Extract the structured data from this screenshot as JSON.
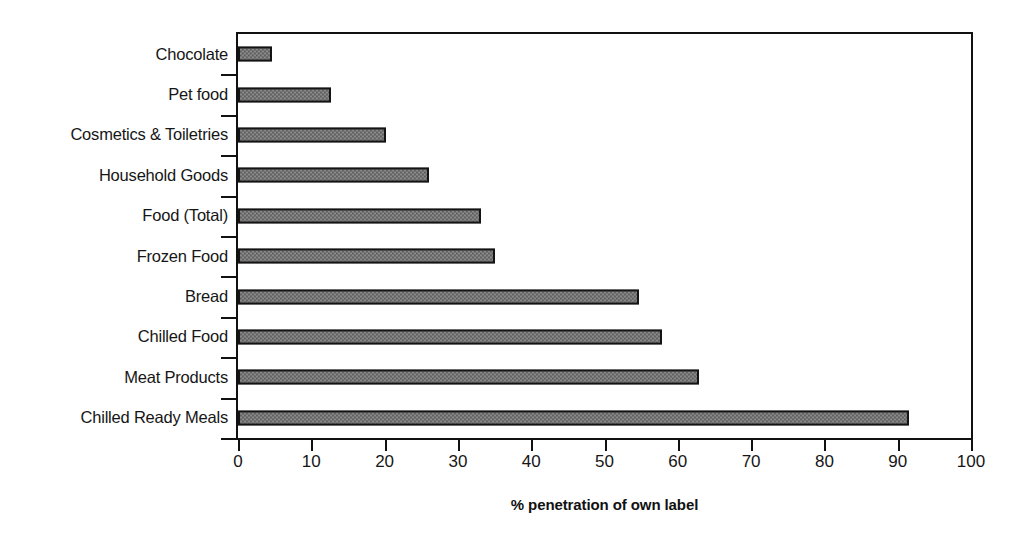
{
  "chart_data": {
    "type": "bar",
    "orientation": "horizontal",
    "title": "",
    "xlabel": "% penetration of own label",
    "ylabel": "",
    "xlim": [
      0,
      100
    ],
    "xticks": [
      0,
      10,
      20,
      30,
      40,
      50,
      60,
      70,
      80,
      90,
      100
    ],
    "grid": false,
    "legend": false,
    "categories": [
      "Chocolate",
      "Pet food",
      "Cosmetics & Toiletries",
      "Household Goods",
      "Food (Total)",
      "Frozen Food",
      "Bread",
      "Chilled Food",
      "Meat Products",
      "Chilled Ready Meals"
    ],
    "values": [
      4.6,
      12.7,
      20.2,
      26.1,
      33.2,
      35.0,
      54.7,
      57.9,
      62.9,
      91.5
    ],
    "bar_fill_color": "#8a8a8a",
    "bar_edge_color": "#141414",
    "axis_color": "#111111",
    "background_color": "#ffffff"
  }
}
